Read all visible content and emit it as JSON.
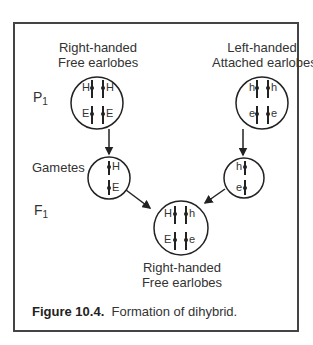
{
  "title_left": {
    "line1": "Right-handed",
    "line2": "Free earlobes"
  },
  "title_right": {
    "line1": "Left-handed",
    "line2": "Attached earlobes"
  },
  "row_labels": {
    "p1": "P",
    "p1_sub": "1",
    "gametes": "Gametes",
    "f1": "F",
    "f1_sub": "1"
  },
  "parent_left_alleles": [
    "H",
    "H",
    "E",
    "E"
  ],
  "parent_right_alleles": [
    "h",
    "h",
    "e",
    "e"
  ],
  "gamete_left_alleles": [
    "H",
    "E"
  ],
  "gamete_right_alleles": [
    "h",
    "e"
  ],
  "f1_alleles": [
    "H",
    "h",
    "E",
    "e"
  ],
  "f1_phenotype": {
    "line1": "Right-handed",
    "line2": "Free earlobes"
  },
  "caption": {
    "label": "Figure 10.4.",
    "text": "Formation of dihybrid."
  }
}
